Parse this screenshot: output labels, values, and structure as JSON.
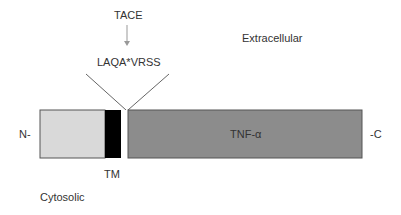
{
  "diagram": {
    "enzyme_label": "TACE",
    "cleavage_site_label": "LAQA*VRSS",
    "extracellular_label": "Extracellular",
    "cytosolic_label": "Cytosolic",
    "n_terminus_label": "N-",
    "c_terminus_label": "-C",
    "tm_label": "TM",
    "domain_label": "TNF-α",
    "colors": {
      "cytoplasmic_segment": "#d9d9d9",
      "transmembrane_segment": "#000000",
      "linker_segment": "#ffffff",
      "tnf_segment": "#8c8c8c",
      "arrow": "#999999",
      "lines": "#666666"
    }
  }
}
